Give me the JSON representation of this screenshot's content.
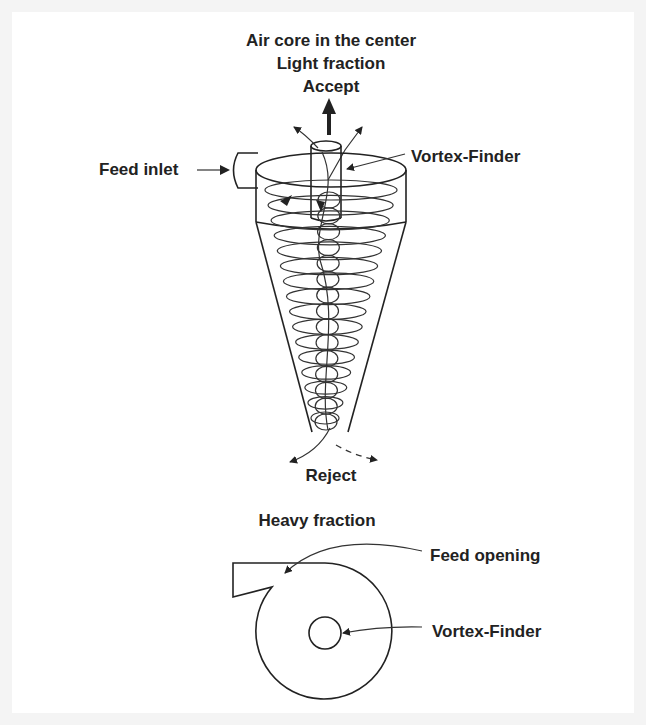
{
  "diagram": {
    "labels": {
      "air_core": "Air core in the center",
      "light_fraction": "Light fraction",
      "accept": "Accept",
      "feed_inlet": "Feed inlet",
      "vortex_finder_top": "Vortex-Finder",
      "reject": "Reject",
      "heavy_fraction": "Heavy fraction",
      "feed_opening": "Feed opening",
      "vortex_finder_bottom": "Vortex-Finder"
    },
    "colors": {
      "ink": "#222222",
      "background": "#ffffff",
      "frame": "#f4f4f4"
    }
  }
}
